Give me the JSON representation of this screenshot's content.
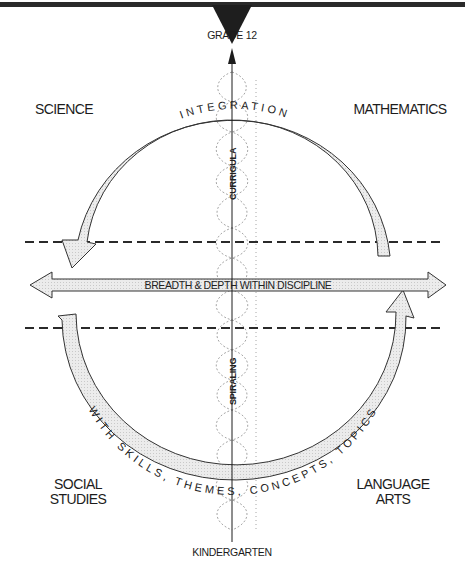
{
  "diagram": {
    "axis": {
      "top_label": "GRADE 12",
      "bottom_label": "KINDERGARTEN",
      "upper_vertical_label": "CURRIGULA",
      "lower_vertical_label": "SPIRALING"
    },
    "quadrants": {
      "top_left": [
        "SCIENCE"
      ],
      "top_right": [
        "MATHEMATICS"
      ],
      "bottom_left": [
        "SOCIAL",
        "STUDIES"
      ],
      "bottom_right": [
        "LANGUAGE",
        "ARTS"
      ]
    },
    "top_arc_label": "INTEGRATION",
    "bottom_arc_label": "WITH SKILLS, THEMES, CONCEPTS, TOPICS",
    "horizontal_arrow_label": "BREADTH & DEPTH WITHIN DISCIPLINE",
    "colors": {
      "ink": "#1c1c1c",
      "band_fill": "#e6e6e6",
      "spiral": "#a8a8a8",
      "background": "#ffffff"
    }
  }
}
